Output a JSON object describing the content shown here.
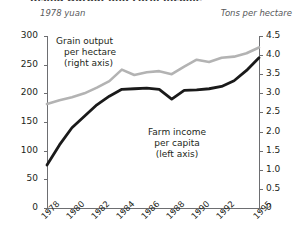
{
  "title": "Rising Output and Farm Income",
  "unit_left": "1978 yuan",
  "unit_right": "Tons per hectare",
  "annotations": {
    "grain": {
      "l1": "Grain output",
      "l2": "per hectare",
      "l3": "(right axis)"
    },
    "farm": {
      "l1": "Farm income",
      "l2": "per capita",
      "l3": "(left axis)"
    }
  },
  "colors": {
    "farm_income_line": "#1a1a1a",
    "grain_output_line": "#b3b3b3",
    "axis": "#6d6e71",
    "text": "#231f20",
    "unit_text": "#58595b"
  },
  "chart_data": {
    "type": "line",
    "title": "Rising Output and Farm Income",
    "xlabel": "",
    "ylabel": "1978 yuan",
    "y2label": "Tons per hectare",
    "ylim": [
      0,
      300
    ],
    "y2lim": [
      0,
      4.5
    ],
    "yticks": [
      0,
      50,
      100,
      150,
      200,
      250,
      300
    ],
    "y2ticks": [
      0,
      0.5,
      1.0,
      1.5,
      2.0,
      2.5,
      3.0,
      3.5,
      4.0,
      4.5
    ],
    "ytick_labels": [
      "0",
      "50",
      "100",
      "150",
      "200",
      "250",
      "300"
    ],
    "y2tick_labels": [
      "0",
      "0.5",
      "1.0",
      "1.5",
      "2.0",
      "2.5",
      "3.0",
      "3.5",
      "4.0",
      "4.5"
    ],
    "grid": false,
    "legend": "inline-annotations",
    "x": [
      1978,
      1979,
      1980,
      1981,
      1982,
      1983,
      1984,
      1985,
      1986,
      1987,
      1988,
      1989,
      1990,
      1991,
      1992,
      1993,
      1994,
      1995
    ],
    "xtick_labels": [
      "1978",
      "1980",
      "1982",
      "1984",
      "1986",
      "1988",
      "1990",
      "1992",
      "1995"
    ],
    "xticks": [
      1978,
      1980,
      1982,
      1984,
      1986,
      1988,
      1990,
      1992,
      1995
    ],
    "series": [
      {
        "name": "Farm income per capita (left axis)",
        "axis": "left",
        "color": "#1a1a1a",
        "values": [
          75,
          110,
          140,
          160,
          180,
          195,
          207,
          208,
          209,
          207,
          190,
          205,
          206,
          208,
          212,
          222,
          240,
          262
        ]
      },
      {
        "name": "Grain output per hectare (right axis)",
        "axis": "right",
        "color": "#b3b3b3",
        "values": [
          2.72,
          2.82,
          2.9,
          3.0,
          3.15,
          3.32,
          3.62,
          3.48,
          3.55,
          3.58,
          3.5,
          3.7,
          3.88,
          3.82,
          3.93,
          3.96,
          4.05,
          4.2
        ]
      }
    ]
  }
}
